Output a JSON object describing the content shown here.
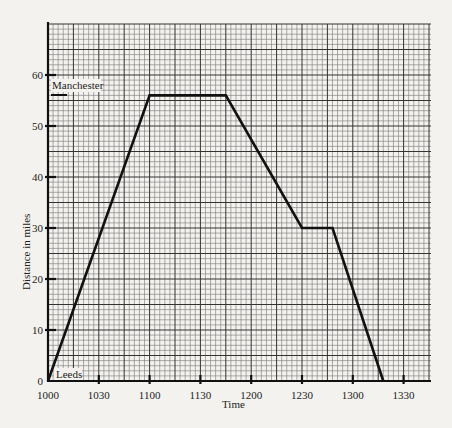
{
  "chart_data": {
    "type": "line",
    "title": "",
    "xlabel": "Time",
    "ylabel": "Distance in miles",
    "x_ticks": [
      "1000",
      "1030",
      "1100",
      "1130",
      "1200",
      "1230",
      "1300",
      "1330"
    ],
    "x_tick_minutes": [
      0,
      30,
      60,
      90,
      120,
      150,
      180,
      210
    ],
    "y_ticks": [
      0,
      10,
      20,
      30,
      40,
      50,
      60
    ],
    "xlim_minutes": [
      0,
      226
    ],
    "ylim": [
      0,
      70
    ],
    "grid": true,
    "annotations": [
      {
        "text": "Manchester",
        "y": 56
      },
      {
        "text": "Leeds",
        "y": 0
      }
    ],
    "series": [
      {
        "name": "Journey",
        "points": [
          {
            "time": "1000",
            "minutes": 0,
            "distance": 0
          },
          {
            "time": "1100",
            "minutes": 60,
            "distance": 56
          },
          {
            "time": "1145",
            "minutes": 105,
            "distance": 56
          },
          {
            "time": "1230",
            "minutes": 150,
            "distance": 30
          },
          {
            "time": "1248",
            "minutes": 168,
            "distance": 30
          },
          {
            "time": "1318",
            "minutes": 198,
            "distance": 0
          }
        ]
      }
    ]
  },
  "labels": {
    "xlabel": "Time",
    "ylabel": "Distance in miles",
    "manchester": "Manchester",
    "leeds": "Leeds"
  }
}
